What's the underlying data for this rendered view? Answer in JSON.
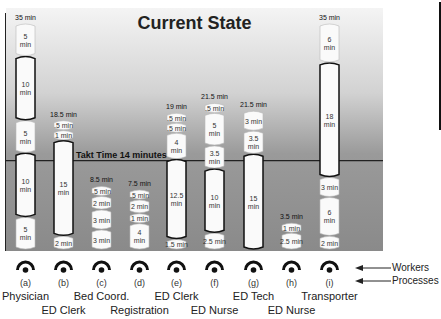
{
  "chart_data": {
    "type": "bar",
    "subtype": "stacked",
    "title": "Current State",
    "ylabel": "",
    "xlabel": "",
    "unit": "min",
    "ylim": [
      0,
      35
    ],
    "takt": {
      "value": 14,
      "label": "Takt Time 14 minutes"
    },
    "categories": [
      {
        "id": "(a)",
        "role": "Physician",
        "total": "35 min",
        "segments": [
          {
            "value": 5,
            "label": "5 min"
          },
          {
            "value": 10,
            "label": "10 min"
          },
          {
            "value": 5,
            "label": "5 min"
          },
          {
            "value": 10,
            "label": "10 min"
          },
          {
            "value": 5,
            "label": "5 min"
          }
        ]
      },
      {
        "id": "(b)",
        "role": "ED Clerk",
        "total": "18.5 min",
        "segments": [
          {
            "value": 0.5,
            "label": ".5 min"
          },
          {
            "value": 1,
            "label": "1 min"
          },
          {
            "value": 15,
            "label": "15 min"
          },
          {
            "value": 2,
            "label": "2 min"
          }
        ]
      },
      {
        "id": "(c)",
        "role": "Bed Coord.",
        "total": "8.5 min",
        "segments": [
          {
            "value": 0.5,
            "label": ".5 min"
          },
          {
            "value": 2,
            "label": "2 min"
          },
          {
            "value": 3,
            "label": "3 min"
          },
          {
            "value": 3,
            "label": "3 min"
          }
        ]
      },
      {
        "id": "(d)",
        "role": "Registration",
        "total": "7.5 min",
        "segments": [
          {
            "value": 0.5,
            "label": ".5 min"
          },
          {
            "value": 2,
            "label": "2 min"
          },
          {
            "value": 1,
            "label": "1 min"
          },
          {
            "value": 4,
            "label": "4 min"
          }
        ]
      },
      {
        "id": "(e)",
        "role": "ED Clerk",
        "total": "19 min",
        "segments": [
          {
            "value": 0.5,
            "label": ".5 min"
          },
          {
            "value": 0.5,
            "label": ".5 min"
          },
          {
            "value": 4,
            "label": "4 min"
          },
          {
            "value": 12.5,
            "label": "12.5 min"
          },
          {
            "value": 1.5,
            "label": "1.5 min"
          }
        ]
      },
      {
        "id": "(f)",
        "role": "ED Nurse",
        "total": "21.5 min",
        "segments": [
          {
            "value": 0.5,
            "label": ".5 min"
          },
          {
            "value": 5,
            "label": "5 min"
          },
          {
            "value": 3.5,
            "label": "3.5 min"
          },
          {
            "value": 10,
            "label": "10 min"
          },
          {
            "value": 2.5,
            "label": "2.5 min"
          }
        ]
      },
      {
        "id": "(g)",
        "role": "ED Tech",
        "total": "21.5 min",
        "segments": [
          {
            "value": 3,
            "label": "3 min"
          },
          {
            "value": 3.5,
            "label": "3.5 min"
          },
          {
            "value": 15,
            "label": "15 min"
          }
        ]
      },
      {
        "id": "(h)",
        "role": "ED Nurse",
        "total": "3.5 min",
        "segments": [
          {
            "value": 1,
            "label": "1 min"
          },
          {
            "value": 2.5,
            "label": "2.5 min"
          }
        ]
      },
      {
        "id": "(i)",
        "role": "Transporter",
        "total": "35 min",
        "segments": [
          {
            "value": 6,
            "label": "6 min"
          },
          {
            "value": 18,
            "label": "18 min"
          },
          {
            "value": 3,
            "label": "3 min"
          },
          {
            "value": 6,
            "label": "6 min"
          },
          {
            "value": 2,
            "label": "2 min"
          }
        ]
      }
    ],
    "legend": [
      {
        "label": "Workers",
        "icon": "worker-icon"
      },
      {
        "label": "Processes",
        "icon": "arrow-left-icon"
      }
    ],
    "grid": false
  }
}
